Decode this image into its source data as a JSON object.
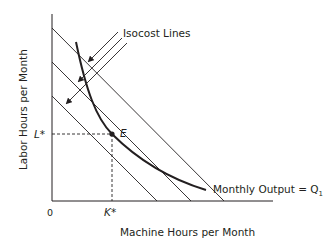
{
  "diagram": {
    "y_axis_label": "Labor Hours per Month",
    "x_axis_label": "Machine Hours per Month",
    "origin_label": "0",
    "isocost_label": "Isocost Lines",
    "isoquant_label": "Monthly Output = Q",
    "isoquant_subscript": "1",
    "point_label": "E",
    "k_star": "K*",
    "l_star": "L*",
    "colors": {
      "line": "#231f20",
      "background": "#ffffff"
    }
  }
}
